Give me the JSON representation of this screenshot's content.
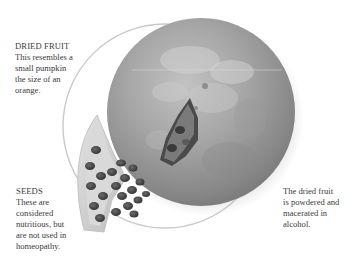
{
  "page": {
    "type": "illustrated reference page",
    "palette": {
      "background": "#ffffff",
      "text": "#3b3b3b",
      "circle_frame": "#c8c8c8",
      "fruit_base": "#8e8e8e",
      "fruit_highlight": "#c4c4c4",
      "seed_dark": "#3e3e3e",
      "rind": "#d6d6d6"
    }
  },
  "illustration": {
    "subject": "dried fruit with cut-away seed wedge",
    "elements": [
      "circle-frame",
      "dried-fruit",
      "seed-wedge",
      "cut-opening"
    ]
  },
  "captions": {
    "dried_fruit": {
      "heading": "DRIED FRUIT",
      "lines": [
        "This resembles a",
        "small pumpkin",
        "the size of an",
        "orange."
      ]
    },
    "seeds": {
      "heading": "SEEDS",
      "lines": [
        "These are",
        "considered",
        "nutritious, but",
        "are not used in",
        "homeopathy."
      ]
    },
    "preparation": {
      "lines": [
        "The dried fruit",
        "is powdered and",
        "macerated in",
        "alcohol."
      ]
    }
  }
}
